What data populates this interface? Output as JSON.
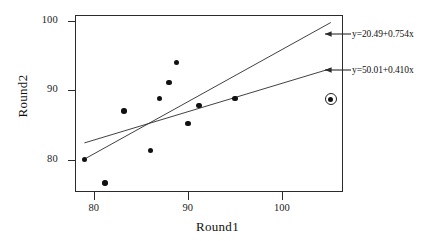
{
  "chart_data": {
    "type": "scatter",
    "title": "",
    "xlabel": "Round1",
    "ylabel": "Round2",
    "xlim": [
      78.0,
      106.5
    ],
    "ylim": [
      75.3,
      100.9
    ],
    "xticks": [
      80,
      90,
      100
    ],
    "yticks": [
      80,
      90,
      100
    ],
    "xticklabels": [
      "80",
      "90",
      "100"
    ],
    "yticklabels": [
      "80",
      "90",
      "100"
    ],
    "grid": false,
    "legend": "none",
    "points": [
      {
        "x": 79.0,
        "y": 80.0
      },
      {
        "x": 81.2,
        "y": 76.6
      },
      {
        "x": 83.2,
        "y": 87.0
      },
      {
        "x": 86.0,
        "y": 81.3
      },
      {
        "x": 87.0,
        "y": 88.8
      },
      {
        "x": 88.0,
        "y": 91.1
      },
      {
        "x": 88.8,
        "y": 94.0
      },
      {
        "x": 90.0,
        "y": 85.2
      },
      {
        "x": 91.2,
        "y": 87.8
      },
      {
        "x": 95.0,
        "y": 88.8
      },
      {
        "x": 105.2,
        "y": 88.7
      }
    ],
    "highlighted_points": [
      {
        "x": 105.2,
        "y": 88.7,
        "marker": "circled"
      }
    ],
    "fit_lines": [
      {
        "label": "y=20.49+0.754x",
        "intercept": 20.49,
        "slope": 0.754,
        "x_start": 79.0,
        "x_end": 105.2
      },
      {
        "label": "y=50.01+0.410x",
        "intercept": 50.01,
        "slope": 0.41,
        "x_start": 79.0,
        "x_end": 105.2
      }
    ],
    "annotations": [
      {
        "text": "y=20.49+0.754x",
        "arrow": "left-pointing"
      },
      {
        "text": "y=50.01+0.410x",
        "arrow": "left-pointing"
      }
    ],
    "colors": {
      "point": "#111111",
      "line": "#2b2b2b",
      "frame": "#2b2b2b",
      "text": "#111111",
      "background": "#ffffff"
    }
  }
}
